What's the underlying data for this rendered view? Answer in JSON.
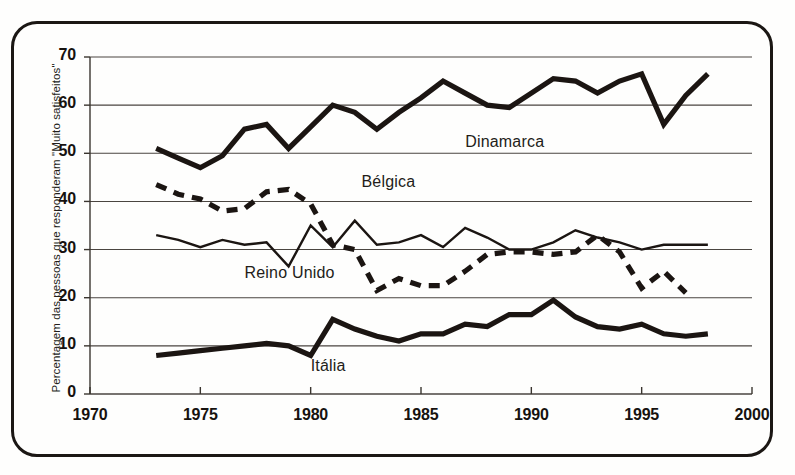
{
  "chart_data": {
    "type": "line",
    "title": "",
    "subtitle": "",
    "xlabel": "",
    "ylabel": "Percentagem das pessoas que responderam \"Muito satisfeitos\"",
    "xlim": [
      1970,
      2000
    ],
    "ylim": [
      0,
      70
    ],
    "xticks": [
      "1970",
      "1975",
      "1980",
      "1985",
      "1990",
      "1995",
      "2000"
    ],
    "yticks": [
      "0",
      "10",
      "20",
      "30",
      "40",
      "50",
      "60",
      "70"
    ],
    "grid": "horizontal",
    "legend_position": "inline-annotations",
    "series": [
      {
        "name": "Dinamarca",
        "style": "thick-solid",
        "color": "#1b1512",
        "label_x": 1987.0,
        "label_y": 52.2,
        "x": [
          1973,
          1974,
          1975,
          1976,
          1977,
          1978,
          1979,
          1980,
          1981,
          1982,
          1983,
          1984,
          1985,
          1986,
          1987,
          1988,
          1989,
          1990,
          1991,
          1992,
          1993,
          1994,
          1995,
          1996,
          1997,
          1998
        ],
        "values": [
          51.0,
          49.0,
          47.0,
          49.5,
          55.0,
          56.0,
          51.0,
          55.5,
          60.0,
          58.5,
          55.0,
          58.5,
          61.5,
          65.0,
          62.5,
          60.0,
          59.5,
          62.5,
          65.5,
          65.0,
          62.5,
          65.0,
          66.5,
          56.0,
          62.0,
          66.5
        ]
      },
      {
        "name": "Bélgica",
        "style": "thick-dashed",
        "color": "#1b1512",
        "label_x": 1982.3,
        "label_y": 43.8,
        "x": [
          1973,
          1974,
          1975,
          1976,
          1977,
          1978,
          1979,
          1980,
          1981,
          1982,
          1983,
          1984,
          1985,
          1986,
          1987,
          1988,
          1989,
          1990,
          1991,
          1992,
          1993,
          1994,
          1995,
          1996,
          1997
        ],
        "values": [
          43.5,
          41.5,
          40.5,
          38.0,
          38.5,
          42.0,
          42.5,
          39.5,
          31.0,
          30.0,
          21.5,
          24.0,
          22.5,
          22.5,
          25.5,
          29.0,
          29.5,
          29.5,
          29.0,
          29.5,
          33.0,
          29.5,
          22.0,
          25.5,
          21.0
        ]
      },
      {
        "name": "Reino Unido",
        "style": "thin-solid",
        "color": "#1b1512",
        "label_x": 1977.0,
        "label_y": 25.0,
        "x": [
          1973,
          1974,
          1975,
          1976,
          1977,
          1978,
          1979,
          1980,
          1981,
          1982,
          1983,
          1984,
          1985,
          1986,
          1987,
          1988,
          1989,
          1990,
          1991,
          1992,
          1993,
          1994,
          1995,
          1996,
          1997,
          1998
        ],
        "values": [
          33.0,
          32.0,
          30.5,
          32.0,
          31.0,
          31.5,
          26.5,
          35.0,
          30.5,
          36.0,
          31.0,
          31.5,
          33.0,
          30.5,
          34.5,
          32.5,
          30.0,
          30.0,
          31.5,
          34.0,
          32.5,
          31.5,
          30.0,
          31.0,
          31.0,
          31.0
        ]
      },
      {
        "name": "Itália",
        "style": "thick-solid",
        "color": "#1b1512",
        "label_x": 1980.0,
        "label_y": 5.6,
        "x": [
          1973,
          1974,
          1975,
          1976,
          1977,
          1978,
          1979,
          1980,
          1981,
          1982,
          1983,
          1984,
          1985,
          1986,
          1987,
          1988,
          1989,
          1990,
          1991,
          1992,
          1993,
          1994,
          1995,
          1996,
          1997,
          1998
        ],
        "values": [
          8.0,
          8.5,
          9.0,
          9.5,
          10.0,
          10.5,
          10.0,
          8.0,
          15.5,
          13.5,
          12.0,
          11.0,
          12.5,
          12.5,
          14.5,
          14.0,
          16.5,
          16.5,
          19.5,
          16.0,
          14.0,
          13.5,
          14.5,
          12.5,
          12.0,
          12.5
        ]
      }
    ]
  },
  "axes": {
    "y_axis_name": "percentage-axis",
    "x_axis_name": "year-axis"
  }
}
